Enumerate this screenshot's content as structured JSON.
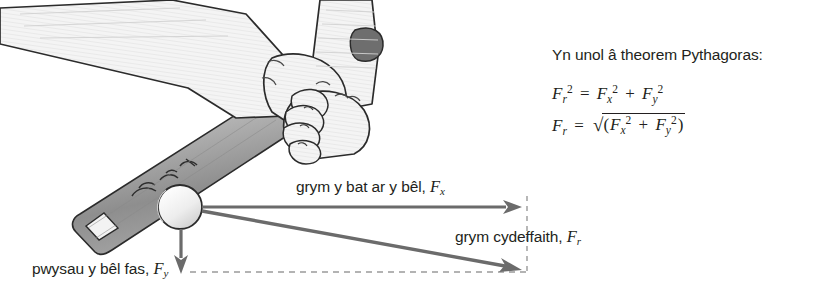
{
  "figure": {
    "background_color": "#ffffff"
  },
  "illustration": {
    "objects": [
      {
        "name": "forearms",
        "description": "two forearms gripping bat handle"
      },
      {
        "name": "hands",
        "description": "hands gripping bat"
      },
      {
        "name": "bat",
        "description": "baseball bat angled from upper right to lower left"
      },
      {
        "name": "ball",
        "description": "baseball at contact point on bat barrel"
      }
    ],
    "colors": {
      "outline": "#231f20",
      "skin_fill": "#f2f2f2",
      "bat_fill": "#a8a8a8",
      "ball_fill": "#f0f0f0",
      "thumb_shade": "#6e6e6e"
    }
  },
  "vectors": {
    "arrow_color": "#6b6b6b",
    "dashed_color": "#9a9a9a",
    "items": [
      {
        "name": "force-bat-on-ball",
        "label_text": "grym y bat ar y bêl,",
        "symbol": "F",
        "subscript": "x",
        "direction": "right",
        "from": [
          202,
          207
        ],
        "to": [
          520,
          207
        ]
      },
      {
        "name": "weight-of-ball",
        "label_text": "pwysau y bêl fas,",
        "symbol": "F",
        "subscript": "y",
        "direction": "down",
        "from": [
          181,
          229
        ],
        "to": [
          181,
          272
        ]
      },
      {
        "name": "resultant-force",
        "label_text": "grym cydeffaith,",
        "symbol": "F",
        "subscript": "r",
        "direction": "down-right",
        "from": [
          202,
          211
        ],
        "to": [
          521,
          269
        ]
      }
    ],
    "construction_lines": [
      {
        "name": "vertical-dashed-guide",
        "from": [
          527,
          196
        ],
        "to": [
          527,
          275
        ]
      },
      {
        "name": "horizontal-dashed-guide",
        "from": [
          190,
          272
        ],
        "to": [
          527,
          272
        ]
      }
    ]
  },
  "pythagoras": {
    "heading": "Yn unol â theorem Pythagoras:",
    "equation_1": {
      "lhs_symbol": "F",
      "lhs_sub": "r",
      "lhs_sup": "2",
      "equals": "=",
      "term_1_symbol": "F",
      "term_1_sub": "x",
      "term_1_sup": "2",
      "plus": "+",
      "term_2_symbol": "F",
      "term_2_sub": "y",
      "term_2_sup": "2",
      "plain": "F_r^2 = F_x^2 + F_y^2"
    },
    "equation_2": {
      "lhs_symbol": "F",
      "lhs_sub": "r",
      "equals": "=",
      "radical": "√",
      "open_paren": "(",
      "term_1_symbol": "F",
      "term_1_sub": "x",
      "term_1_sup": "2",
      "plus": "+",
      "term_2_symbol": "F",
      "term_2_sub": "y",
      "term_2_sup": "2",
      "close_paren": ")",
      "plain": "F_r = √(F_x^2 + F_y^2)"
    }
  }
}
